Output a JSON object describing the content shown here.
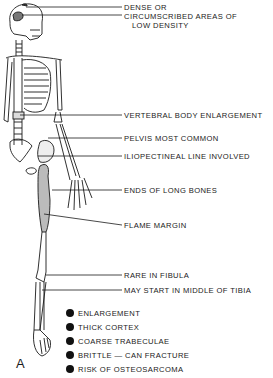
{
  "figure": {
    "panel_label": "A",
    "callouts": [
      {
        "id": "skull-dense",
        "text": "DENSE OR"
      },
      {
        "id": "skull-lucent",
        "text": "CIRCUMSCRIBED AREAS OF"
      },
      {
        "id": "skull-lucent-2",
        "text": "LOW DENSITY"
      },
      {
        "id": "vertebra",
        "text": "VERTEBRAL BODY ENLARGEMENT"
      },
      {
        "id": "pelvis",
        "text": "PELVIS MOST COMMON"
      },
      {
        "id": "iliopectineal",
        "text": "ILIOPECTINEAL LINE INVOLVED"
      },
      {
        "id": "long-bones",
        "text": "ENDS OF LONG BONES"
      },
      {
        "id": "flame",
        "text": "FLAME MARGIN"
      },
      {
        "id": "fibula",
        "text": "RARE IN FIBULA"
      },
      {
        "id": "tibia",
        "text": "MAY START IN MIDDLE OF TIBIA"
      }
    ],
    "features": [
      "ENLARGEMENT",
      "THICK CORTEX",
      "COARSE TRABECULAE",
      "BRITTLE — CAN FRACTURE",
      "RISK OF OSTEOSARCOMA"
    ]
  }
}
